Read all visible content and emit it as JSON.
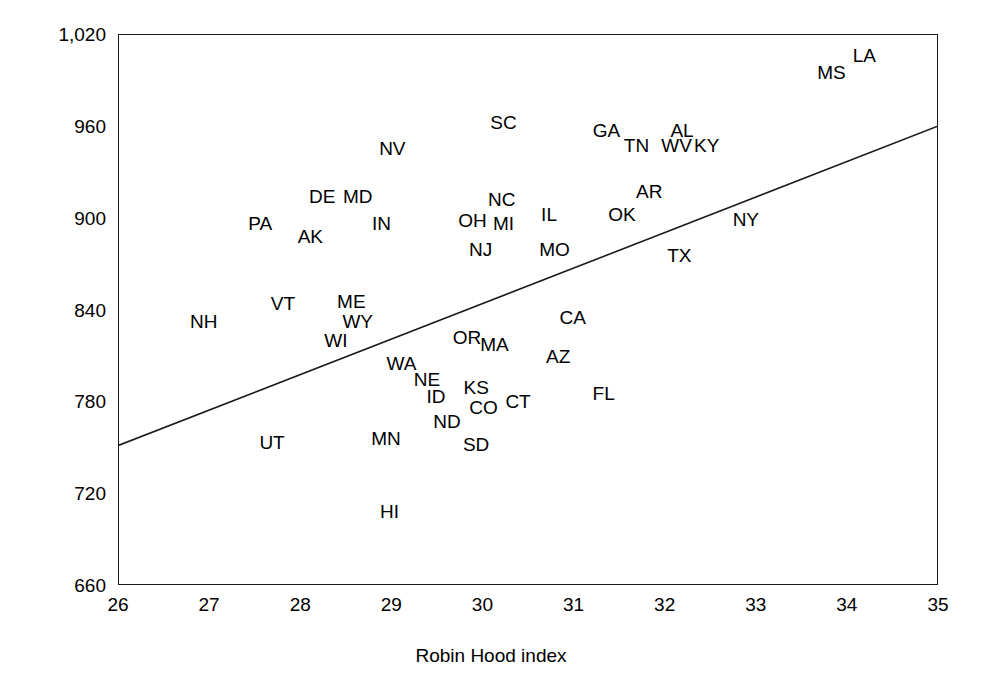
{
  "chart_data": {
    "type": "scatter",
    "title": "",
    "xlabel": "Robin Hood index",
    "ylabel": "Age-adjusted mortality rate",
    "xlim": [
      26,
      35
    ],
    "ylim": [
      660,
      1020
    ],
    "xticks": [
      "26",
      "27",
      "28",
      "29",
      "30",
      "31",
      "32",
      "33",
      "34",
      "35"
    ],
    "yticks": [
      "1,020",
      "960",
      "900",
      "840",
      "780",
      "720",
      "660"
    ],
    "grid": false,
    "legend": null,
    "point_style": "text-label",
    "marker_color": "#000000",
    "line_color": "#1a1a1a",
    "frame_color": "#1a1a1a",
    "background": "#ffffff",
    "trendline": {
      "label": "regression-line",
      "x_start": 26,
      "y_start": 751,
      "x_end": 35,
      "y_end": 960
    },
    "points": [
      {
        "label": "NH",
        "x": 26.93,
        "y": 833
      },
      {
        "label": "PA",
        "x": 27.55,
        "y": 897
      },
      {
        "label": "VT",
        "x": 27.8,
        "y": 845
      },
      {
        "label": "UT",
        "x": 27.68,
        "y": 754
      },
      {
        "label": "AK",
        "x": 28.1,
        "y": 889
      },
      {
        "label": "DE",
        "x": 28.23,
        "y": 915
      },
      {
        "label": "ME",
        "x": 28.55,
        "y": 846
      },
      {
        "label": "WY",
        "x": 28.62,
        "y": 833
      },
      {
        "label": "WI",
        "x": 28.38,
        "y": 821
      },
      {
        "label": "MD",
        "x": 28.62,
        "y": 915
      },
      {
        "label": "IN",
        "x": 28.88,
        "y": 897
      },
      {
        "label": "WA",
        "x": 29.1,
        "y": 806
      },
      {
        "label": "NE",
        "x": 29.38,
        "y": 795
      },
      {
        "label": "MN",
        "x": 28.93,
        "y": 757
      },
      {
        "label": "ID",
        "x": 29.48,
        "y": 784
      },
      {
        "label": "ND",
        "x": 29.6,
        "y": 768
      },
      {
        "label": "HI",
        "x": 28.97,
        "y": 709
      },
      {
        "label": "NV",
        "x": 29.0,
        "y": 946
      },
      {
        "label": "OR",
        "x": 29.82,
        "y": 823
      },
      {
        "label": "SD",
        "x": 29.92,
        "y": 753
      },
      {
        "label": "KS",
        "x": 29.92,
        "y": 790
      },
      {
        "label": "CO",
        "x": 30.0,
        "y": 777
      },
      {
        "label": "MA",
        "x": 30.12,
        "y": 818
      },
      {
        "label": "CT",
        "x": 30.38,
        "y": 781
      },
      {
        "label": "OH",
        "x": 29.88,
        "y": 899
      },
      {
        "label": "NJ",
        "x": 29.97,
        "y": 880
      },
      {
        "label": "NC",
        "x": 30.2,
        "y": 913
      },
      {
        "label": "MI",
        "x": 30.22,
        "y": 897
      },
      {
        "label": "SC",
        "x": 30.22,
        "y": 963
      },
      {
        "label": "IL",
        "x": 30.72,
        "y": 903
      },
      {
        "label": "MO",
        "x": 30.78,
        "y": 880
      },
      {
        "label": "AZ",
        "x": 30.82,
        "y": 810
      },
      {
        "label": "CA",
        "x": 30.98,
        "y": 836
      },
      {
        "label": "FL",
        "x": 31.32,
        "y": 786
      },
      {
        "label": "GA",
        "x": 31.35,
        "y": 958
      },
      {
        "label": "OK",
        "x": 31.52,
        "y": 903
      },
      {
        "label": "TN",
        "x": 31.68,
        "y": 948
      },
      {
        "label": "AR",
        "x": 31.82,
        "y": 918
      },
      {
        "label": "WV",
        "x": 32.12,
        "y": 948
      },
      {
        "label": "AL",
        "x": 32.18,
        "y": 958
      },
      {
        "label": "TX",
        "x": 32.15,
        "y": 876
      },
      {
        "label": "KY",
        "x": 32.45,
        "y": 948
      },
      {
        "label": "NY",
        "x": 32.88,
        "y": 900
      },
      {
        "label": "MS",
        "x": 33.82,
        "y": 996
      },
      {
        "label": "LA",
        "x": 34.18,
        "y": 1007
      }
    ]
  }
}
